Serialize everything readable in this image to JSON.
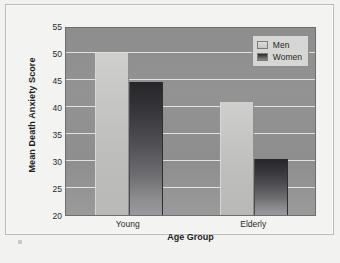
{
  "chart_data": {
    "type": "bar",
    "title": "",
    "xlabel": "Age Group",
    "ylabel": "Mean Death Anxiety Score",
    "categories": [
      "Young",
      "Elderly"
    ],
    "series": [
      {
        "name": "Men",
        "values": [
          50.0,
          41.0
        ],
        "color": "#c6c6c4"
      },
      {
        "name": "Women",
        "values": [
          44.7,
          30.4
        ],
        "color": "#3a3a3e"
      }
    ],
    "ylim": [
      20,
      55
    ],
    "yticks": [
      20,
      25,
      30,
      35,
      40,
      45,
      50,
      55
    ],
    "grid": true,
    "legend_position": "top-right",
    "plot_background": "#929292",
    "gridline_color": "#e8e8e6"
  },
  "legend": {
    "entries": [
      {
        "label": "Men",
        "swatch": "legend-swatch-men"
      },
      {
        "label": "Women",
        "swatch": "legend-swatch-women"
      }
    ]
  }
}
